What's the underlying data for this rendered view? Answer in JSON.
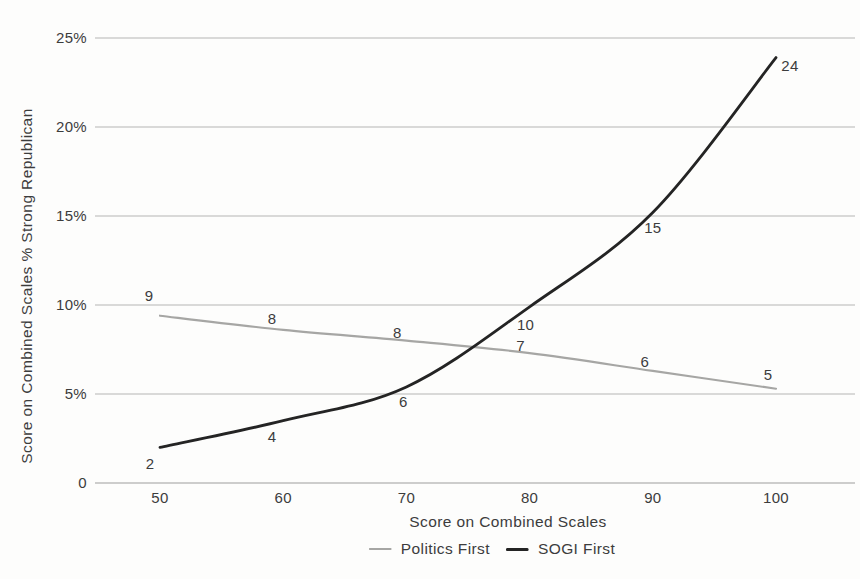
{
  "figure": {
    "background": "#fdfdfc",
    "text_color": "#3c3c3c",
    "gridline_color": "#b6b6b4",
    "axis_line_color": "#9d9d9b"
  },
  "chart_data": {
    "type": "line",
    "title": "",
    "xlabel": "Score on Combined Scales",
    "ylabel": "Score on Combined Scales % Strong Republican",
    "x_ticks": [
      "50",
      "60",
      "70",
      "80",
      "90",
      "100"
    ],
    "y_ticks": [
      {
        "value": 0,
        "label": "0"
      },
      {
        "value": 5,
        "label": "5%"
      },
      {
        "value": 10,
        "label": "10%"
      },
      {
        "value": 15,
        "label": "15%"
      },
      {
        "value": 20,
        "label": "20%"
      },
      {
        "value": 25,
        "label": "25%"
      }
    ],
    "x_range": [
      50,
      100
    ],
    "ylim": [
      0,
      25
    ],
    "grid": "horizontal",
    "legend_position": "bottom-center",
    "series": [
      {
        "name": "Politics First",
        "color": "#a6a6a4",
        "stroke_width": 2.1,
        "x": [
          50,
          60,
          70,
          80,
          90,
          100
        ],
        "values": [
          9,
          8,
          8,
          7,
          6,
          5
        ],
        "plotted_values": [
          9.4,
          8.6,
          8.0,
          7.3,
          6.3,
          5.3
        ],
        "point_labels": [
          "9",
          "8",
          "8",
          "7",
          "6",
          "5"
        ],
        "label_side": "above",
        "label_offsets": [
          [
            -11,
            -20
          ],
          [
            -11,
            -11
          ],
          [
            -9,
            -8
          ],
          [
            -9,
            -7
          ],
          [
            -8,
            -9
          ],
          [
            -8,
            -14
          ]
        ]
      },
      {
        "name": "SOGI First",
        "color": "#242424",
        "stroke_width": 2.8,
        "x": [
          50,
          60,
          70,
          80,
          90,
          100
        ],
        "values": [
          2,
          4,
          6,
          10,
          15,
          24
        ],
        "plotted_values": [
          2.0,
          3.5,
          5.4,
          9.9,
          15.2,
          23.9
        ],
        "point_labels": [
          "2",
          "4",
          "6",
          "10",
          "15",
          "24"
        ],
        "label_side": "below",
        "label_offsets": [
          [
            -10,
            17
          ],
          [
            -11,
            16
          ],
          [
            -3,
            15
          ],
          [
            -4,
            18
          ],
          [
            0,
            16
          ],
          [
            14,
            8
          ]
        ]
      }
    ]
  }
}
